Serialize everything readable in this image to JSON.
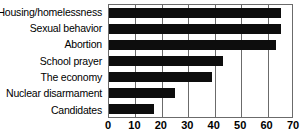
{
  "chart_data": {
    "type": "bar",
    "orientation": "horizontal",
    "title": "",
    "xlabel": "",
    "ylabel": "",
    "xlim": [
      0,
      70
    ],
    "xticks": [
      0,
      10,
      20,
      30,
      40,
      50,
      60,
      70
    ],
    "grid": true,
    "legend": false,
    "bar_color": "#0d0d0d",
    "categories": [
      "Housing/homelessness",
      "Sexual behavior",
      "Abortion",
      "School prayer",
      "The economy",
      "Nuclear disarmament",
      "Candidates"
    ],
    "values": [
      65,
      65,
      63,
      43,
      39,
      25,
      17
    ]
  }
}
